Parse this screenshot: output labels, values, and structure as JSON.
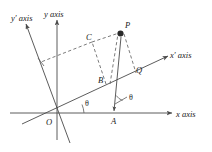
{
  "figure": {
    "type": "geometry-diagram",
    "width": 212,
    "height": 152,
    "background_color": "#ffffff",
    "line_color": "#4a4a4a",
    "label_color": "#1a1a1a"
  },
  "axes": [
    {
      "id": "x-axis",
      "label": "x axis",
      "label_italic_part": "x",
      "label_roman_part": " axis",
      "style": "solid",
      "arrow": true
    },
    {
      "id": "y-axis",
      "label": "y axis",
      "label_italic_part": "y",
      "label_roman_part": " axis",
      "style": "solid",
      "arrow": true
    },
    {
      "id": "x-prime-axis",
      "label": "x′ axis",
      "label_italic_part": "x′",
      "label_roman_part": " axis",
      "style": "solid",
      "arrow": true
    },
    {
      "id": "y-prime-axis",
      "label": "y′ axis",
      "label_italic_part": "y′",
      "label_roman_part": " axis",
      "style": "solid",
      "arrow": true
    }
  ],
  "points": [
    {
      "id": "point-O",
      "label": "O",
      "marker": "none",
      "note": "origin"
    },
    {
      "id": "point-P",
      "label": "P",
      "marker": "filled-dot",
      "note": "plotted point"
    },
    {
      "id": "point-A",
      "label": "A",
      "marker": "none",
      "note": "foot on x axis"
    },
    {
      "id": "point-B",
      "label": "B",
      "marker": "none",
      "note": "on x-prime axis"
    },
    {
      "id": "point-C",
      "label": "C",
      "marker": "none",
      "note": "on y-prime direction"
    },
    {
      "id": "point-Q",
      "label": "Q",
      "marker": "none",
      "note": "foot on x-prime axis"
    }
  ],
  "angles": [
    {
      "id": "angle-theta-origin",
      "label": "θ",
      "note": "between x axis and x′ axis at O"
    },
    {
      "id": "angle-theta-at-a",
      "label": "θ",
      "note": "between PA and x′ direction at A"
    }
  ],
  "segments": [
    {
      "id": "segment-C-P",
      "style": "dashed",
      "note": "C to P"
    },
    {
      "id": "segment-C-yprime",
      "style": "dashed",
      "note": "C toward y′ axis"
    },
    {
      "id": "segment-B-P",
      "style": "dashed",
      "note": "B up to P"
    },
    {
      "id": "segment-P-Q",
      "style": "dashed",
      "note": "P down to Q"
    },
    {
      "id": "segment-B-C",
      "style": "dashed",
      "note": "B up to C"
    },
    {
      "id": "segment-P-A",
      "style": "solid-arrow",
      "note": "P down to A on x axis"
    }
  ]
}
